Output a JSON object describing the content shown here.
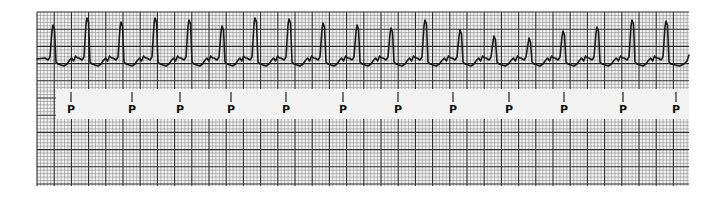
{
  "strip": {
    "grid": {
      "left": 37,
      "top": 12,
      "right": 689,
      "bottom": 186,
      "small_step": 3.44,
      "major_every": 5,
      "paper_color": "#f4f4f4",
      "minor_line_color": "#8a8a8a",
      "major_line_color": "#2a2a2a"
    },
    "label_band": {
      "left": 56,
      "top": 89,
      "right": 689,
      "bottom": 119,
      "color": "#f3f3f3",
      "marker_label": "P",
      "marker_tick_top": 92,
      "marker_tick_bottom": 102,
      "marker_label_y": 113
    },
    "p_wave_markers": [
      71,
      132,
      180,
      231,
      286,
      343,
      398,
      453,
      509,
      564,
      623,
      676
    ],
    "trace": {
      "color": "#1a1a1a",
      "baseline_y": 59,
      "r_peaks": [
        {
          "x": 53,
          "y": 25
        },
        {
          "x": 87,
          "y": 18
        },
        {
          "x": 121,
          "y": 22
        },
        {
          "x": 155,
          "y": 18
        },
        {
          "x": 189,
          "y": 20
        },
        {
          "x": 222,
          "y": 26
        },
        {
          "x": 255,
          "y": 18
        },
        {
          "x": 289,
          "y": 19
        },
        {
          "x": 323,
          "y": 23
        },
        {
          "x": 357,
          "y": 25
        },
        {
          "x": 391,
          "y": 28
        },
        {
          "x": 425,
          "y": 20
        },
        {
          "x": 460,
          "y": 30
        },
        {
          "x": 494,
          "y": 36
        },
        {
          "x": 529,
          "y": 38
        },
        {
          "x": 563,
          "y": 31
        },
        {
          "x": 597,
          "y": 27
        },
        {
          "x": 632,
          "y": 20
        },
        {
          "x": 666,
          "y": 21
        }
      ],
      "start_x": 37,
      "end_x": 689
    }
  }
}
